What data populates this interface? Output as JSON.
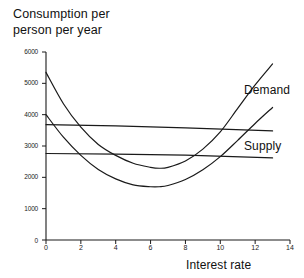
{
  "chart_data": {
    "type": "line",
    "title_line1": "Consumption per",
    "title_line2": "person per year",
    "xlabel": "Interest rate",
    "ylabel": "Consumption per person per year",
    "xlim": [
      0,
      14
    ],
    "ylim": [
      0,
      6000
    ],
    "xticks": [
      0,
      2,
      4,
      6,
      8,
      10,
      12,
      14
    ],
    "yticks": [
      0,
      1000,
      2000,
      3000,
      4000,
      5000,
      6000
    ],
    "xtick_labels": [
      "0",
      "2",
      "4",
      "6",
      "8",
      "10",
      "12",
      "14"
    ],
    "ytick_labels": [
      "0",
      "1000",
      "2000",
      "3000",
      "4000",
      "5000",
      "6000"
    ],
    "grid": false,
    "legend_position": "right-inline",
    "annotations": [
      "Demand",
      "Supply"
    ],
    "series": [
      {
        "name": "Demand",
        "label": "Demand",
        "kind": "curve",
        "x": [
          0,
          1,
          2,
          3,
          4,
          5,
          6,
          6.5,
          7,
          8,
          9,
          10,
          11,
          12,
          13
        ],
        "y": [
          5350,
          4350,
          3600,
          3050,
          2700,
          2450,
          2320,
          2290,
          2320,
          2520,
          2900,
          3450,
          4200,
          4950,
          5620
        ]
      },
      {
        "name": "Demand-lower",
        "label": "",
        "kind": "curve",
        "x": [
          0,
          1,
          2,
          3,
          4,
          5,
          6,
          6.5,
          7,
          8,
          9,
          10,
          11,
          12,
          13
        ],
        "y": [
          4000,
          3280,
          2700,
          2250,
          1950,
          1760,
          1700,
          1700,
          1740,
          1930,
          2240,
          2660,
          3180,
          3720,
          4230
        ]
      },
      {
        "name": "Supply-upper",
        "label": "",
        "kind": "line",
        "x": [
          0,
          4,
          8,
          13
        ],
        "y": [
          3680,
          3640,
          3580,
          3480
        ]
      },
      {
        "name": "Supply",
        "label": "Supply",
        "kind": "line",
        "x": [
          0,
          4,
          8,
          13
        ],
        "y": [
          2760,
          2740,
          2710,
          2620
        ]
      }
    ]
  },
  "colors": {
    "axis": "#1a1a1a",
    "curve": "#1a1a1a",
    "background": "#ffffff",
    "text": "#111111"
  }
}
